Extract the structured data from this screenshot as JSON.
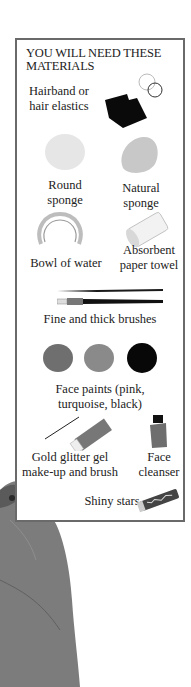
{
  "panel": {
    "title": "YOU WILL NEED THESE MATERIALS",
    "items": [
      {
        "name": "hairband",
        "label_line1": "Hairband or",
        "label_line2": "hair elastics",
        "icon": "hair-elastics-icon"
      },
      {
        "name": "round-sponge",
        "label_line1": "Round",
        "label_line2": "sponge",
        "icon": "round-sponge-icon"
      },
      {
        "name": "natural-sponge",
        "label_line1": "Natural",
        "label_line2": "sponge",
        "icon": "natural-sponge-icon"
      },
      {
        "name": "bowl-of-water",
        "label_line1": "Bowl of water",
        "icon": "bowl-icon"
      },
      {
        "name": "paper-towel",
        "label_line1": "Absorbent",
        "label_line2": "paper towel",
        "icon": "paper-towel-icon"
      },
      {
        "name": "brushes",
        "label_line1": "Fine and thick brushes",
        "icon": "brushes-icon"
      },
      {
        "name": "face-paints",
        "label_line1": "Face paints (pink,",
        "label_line2": "turquoise, black)",
        "icon": "face-paints-icon"
      },
      {
        "name": "glitter-gel",
        "label_line1": "Gold glitter gel",
        "label_line2": "make-up and brush",
        "icon": "glitter-tube-icon"
      },
      {
        "name": "face-cleanser",
        "label_line1": "Face",
        "label_line2": "cleanser",
        "icon": "cleanser-bottle-icon"
      },
      {
        "name": "shiny-stars",
        "label_line1": "Shiny stars",
        "icon": "stars-tube-icon"
      }
    ]
  },
  "colors": {
    "border": "#6a6a6a",
    "paint_pink": "#6f6f6f",
    "paint_turquoise": "#8a8a8a",
    "paint_black": "#080808"
  }
}
